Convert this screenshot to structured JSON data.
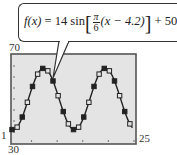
{
  "formula": {
    "lhs": "f(x)",
    "equals": "=",
    "amplitude": "14",
    "func": "sin",
    "frac_num": "π",
    "frac_den": "6",
    "inner": "(x − 4.2)",
    "plus": "+",
    "offset": "50",
    "full_text": "f(x) = 14 sin[π/6 (x − 4.2)] + 50"
  },
  "labels": {
    "ymax": "70",
    "ymin": "30",
    "xmin": "1",
    "xmax": "25"
  },
  "colors": {
    "plot_bg": "#e4e4e4",
    "frame": "#555555",
    "curve": "#222222",
    "marker": "#222222"
  },
  "chart_data": {
    "type": "scatter",
    "title": "",
    "annotation": "f(x) = 14 sin[π/6 (x − 4.2)] + 50",
    "xlabel": "",
    "ylabel": "",
    "xlim": [
      1,
      25
    ],
    "ylim": [
      30,
      70
    ],
    "grid": false,
    "legend": "none",
    "model": {
      "amplitude": 14,
      "period_factor": 0.5236,
      "phase_shift": 4.2,
      "vertical_shift": 50
    },
    "series": [
      {
        "name": "data",
        "marker": "square (alternating filled/hollow)",
        "x": [
          1,
          2,
          3,
          4,
          5,
          6,
          7,
          8,
          9,
          10,
          11,
          12,
          13,
          14,
          15,
          16,
          17,
          18,
          19,
          20,
          21,
          22,
          23,
          24
        ],
        "y": [
          36.1,
          37.2,
          41.8,
          48.5,
          55.7,
          61.3,
          63.9,
          62.8,
          58.2,
          51.5,
          44.3,
          38.7,
          36.1,
          37.2,
          41.8,
          48.5,
          55.7,
          61.3,
          63.9,
          62.8,
          58.2,
          51.5,
          44.3,
          38.7
        ]
      },
      {
        "name": "f(x)",
        "type": "line",
        "x_range": [
          1,
          24.5
        ]
      }
    ]
  }
}
